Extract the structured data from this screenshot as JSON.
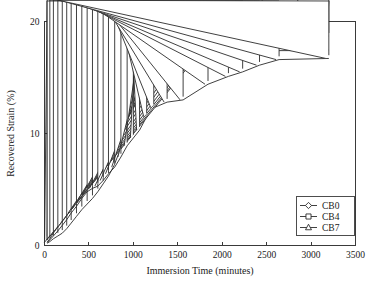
{
  "chart_data": {
    "type": "line",
    "title": "",
    "xlabel": "Immersion Time (minutes)",
    "ylabel": "Recovered Strain (%)",
    "xlim": [
      0,
      3500
    ],
    "ylim": [
      0,
      20
    ],
    "xticks": [
      0,
      500,
      1000,
      1500,
      2000,
      2500,
      3000,
      3500
    ],
    "xticklabels": [
      "0",
      "500",
      "1000",
      "1500",
      "2000",
      "2500",
      "3000",
      "3500"
    ],
    "yticks": [
      0,
      10,
      20
    ],
    "yticklabels": [
      "0",
      "10",
      "20"
    ],
    "grid": false,
    "legend_position": "lower-right",
    "series": [
      {
        "name": "CB0",
        "marker": "diamond",
        "x": [
          30,
          60,
          100,
          150,
          200,
          250,
          300,
          360,
          420,
          480,
          540,
          600,
          660,
          720,
          780,
          840,
          900,
          960,
          1020,
          1090,
          1150,
          1220,
          1300,
          1380,
          1480,
          1600,
          1700,
          1900,
          2100,
          2450,
          2850,
          3200
        ],
        "y": [
          0.2,
          0.35,
          0.6,
          0.85,
          1.1,
          1.5,
          2.0,
          2.6,
          3.2,
          3.7,
          4.2,
          4.8,
          5.5,
          6.2,
          7.1,
          8.3,
          9.5,
          10.7,
          11.8,
          13.2,
          14.4,
          15.6,
          16.4,
          17.1,
          17.6,
          17.9,
          18.2,
          18.5,
          18.7,
          18.7,
          18.7,
          18.7
        ]
      },
      {
        "name": "CB4",
        "marker": "square",
        "x": [
          30,
          60,
          100,
          150,
          200,
          250,
          300,
          360,
          420,
          480,
          540,
          600,
          660,
          720,
          780,
          840,
          900,
          960,
          1030,
          1100,
          1180,
          1280,
          1380,
          1500,
          1600,
          1750,
          1900,
          2150,
          2450,
          2850,
          3200
        ],
        "y": [
          0.3,
          0.6,
          1.1,
          1.8,
          2.6,
          3.6,
          4.4,
          5.4,
          6.8,
          7.7,
          8.5,
          9.2,
          10.7,
          12.2,
          13.0,
          14.2,
          15.1,
          15.9,
          16.1,
          16.2,
          16.4,
          16.7,
          17.0,
          17.1,
          17.2,
          17.3,
          17.3,
          17.35,
          17.4,
          17.4,
          17.45
        ]
      },
      {
        "name": "CB7",
        "marker": "triangle",
        "x": [
          30,
          60,
          100,
          150,
          200,
          250,
          300,
          360,
          420,
          480,
          540,
          600,
          660,
          720,
          790,
          860,
          930,
          1000,
          1070,
          1150,
          1230,
          1380,
          1560,
          1840,
          2070,
          2230,
          2420,
          2640,
          3200
        ],
        "y": [
          0.25,
          0.5,
          0.85,
          1.3,
          1.8,
          2.3,
          2.9,
          3.5,
          4.2,
          4.8,
          5.1,
          5.3,
          5.8,
          6.4,
          7.0,
          7.9,
          8.9,
          9.6,
          10.3,
          11.5,
          12.3,
          12.8,
          13.0,
          14.4,
          15.1,
          15.5,
          16.1,
          16.6,
          16.7
        ]
      }
    ]
  }
}
